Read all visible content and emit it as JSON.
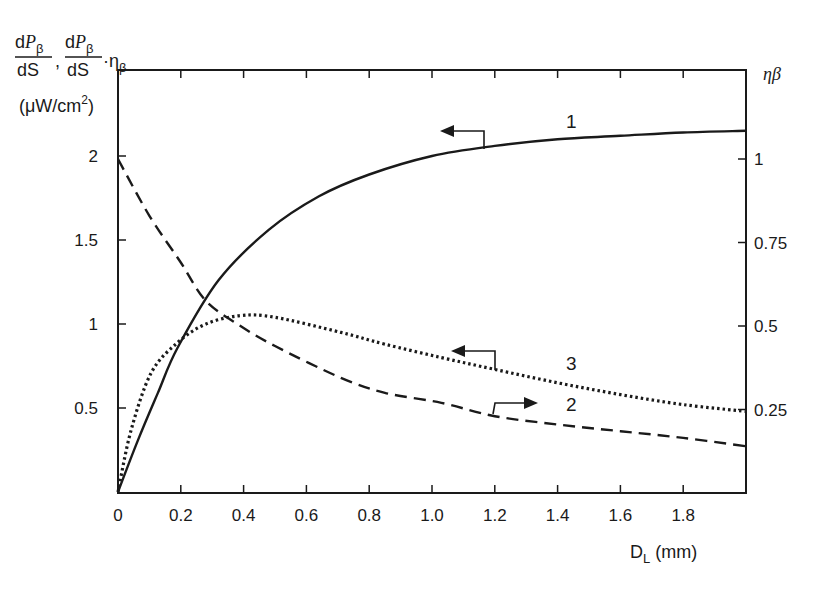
{
  "chart_data": {
    "type": "line",
    "title": "",
    "xlabel": "D_L (mm)",
    "xlabel_main": "D",
    "xlabel_sub": "L",
    "xlabel_unit": "(mm)",
    "ylabel": "dP_β/dS, dP_β/dS·η_β (μW/cm²)",
    "ylabel_parts": {
      "d1": "d",
      "P": "P",
      "beta": "β",
      "dS": "dS",
      "comma": ",",
      "dot_eta": "·η",
      "unit_open": "(μW/cm",
      "unit_sup": "2",
      "unit_close": ")"
    },
    "y2label": "ηβ",
    "y2label_eta": "η",
    "y2label_beta": "β",
    "xlim": [
      0,
      2.0
    ],
    "ylim": [
      0,
      2.5
    ],
    "y2lim": [
      0,
      1.25
    ],
    "x_ticks": [
      0,
      0.2,
      0.4,
      0.6,
      0.8,
      1.0,
      1.2,
      1.4,
      1.6,
      1.8
    ],
    "x_tick_labels": [
      "0",
      "0.2",
      "0.4",
      "0.6",
      "0.8",
      "1.0",
      "1.2",
      "1.4",
      "1.6",
      "1.8"
    ],
    "y_ticks": [
      0.5,
      1,
      1.5,
      2
    ],
    "y_tick_labels": [
      "0.5",
      "1",
      "1.5",
      "2"
    ],
    "y2_ticks": [
      0.25,
      0.5,
      0.75,
      1
    ],
    "y2_tick_labels": [
      "0.25",
      "0.5",
      "0.75",
      "1"
    ],
    "grid": false,
    "legend": "none (curves numbered inline with arrows indicating axis)",
    "series": [
      {
        "name": "1",
        "axis": "left",
        "style": "solid",
        "x": [
          0,
          0.064,
          0.127,
          0.19,
          0.32,
          0.48,
          0.64,
          0.8,
          1.0,
          1.2,
          1.4,
          1.6,
          1.8,
          2.0
        ],
        "y": [
          0,
          0.31,
          0.59,
          0.86,
          1.26,
          1.56,
          1.76,
          1.89,
          2.0,
          2.06,
          2.1,
          2.12,
          2.14,
          2.15
        ]
      },
      {
        "name": "2",
        "axis": "right",
        "style": "dashed",
        "x": [
          0,
          0.1,
          0.2,
          0.28,
          0.39,
          0.5,
          0.71,
          0.85,
          1.03,
          1.2,
          1.4,
          1.6,
          1.8,
          2.0
        ],
        "y": [
          1.0,
          0.83,
          0.69,
          0.575,
          0.5,
          0.44,
          0.345,
          0.3,
          0.27,
          0.23,
          0.205,
          0.185,
          0.165,
          0.14
        ]
      },
      {
        "name": "3",
        "axis": "left",
        "style": "dotted",
        "x": [
          0,
          0.042,
          0.106,
          0.19,
          0.28,
          0.39,
          0.5,
          0.71,
          0.85,
          1.03,
          1.2,
          1.4,
          1.6,
          1.8,
          2.0
        ],
        "y": [
          0,
          0.37,
          0.71,
          0.89,
          1.0,
          1.05,
          1.04,
          0.95,
          0.88,
          0.8,
          0.73,
          0.65,
          0.58,
          0.52,
          0.48
        ]
      }
    ],
    "annotations": [
      {
        "label": "1",
        "x": 1.5,
        "y": 2.25,
        "arrow": "left",
        "arrow_at_x": 1.17
      },
      {
        "label": "3",
        "x": 1.5,
        "y": 0.93,
        "arrow": "left",
        "arrow_at_x": 1.2
      },
      {
        "label": "2",
        "x": 1.5,
        "y": 0.5,
        "arrow": "right",
        "arrow_at_x": 1.2
      }
    ]
  }
}
